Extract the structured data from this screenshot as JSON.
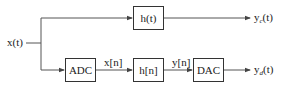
{
  "diagram": {
    "type": "block-diagram",
    "colors": {
      "line": "#555555",
      "box_border": "#333333",
      "text": "#222222",
      "background": "#ffffff"
    },
    "input": {
      "label": "x(t)"
    },
    "top_path": {
      "blocks": [
        {
          "id": "h_t",
          "label": "h(t)"
        }
      ],
      "output": {
        "label_main": "y",
        "label_sub": "c",
        "label_arg": "(t)"
      }
    },
    "bottom_path": {
      "blocks": [
        {
          "id": "adc",
          "label": "ADC"
        },
        {
          "id": "h_n",
          "label": "h[n]"
        },
        {
          "id": "dac",
          "label": "DAC"
        }
      ],
      "signals": [
        {
          "label": "x[n]"
        },
        {
          "label": "y[n]"
        }
      ],
      "output": {
        "label_main": "y",
        "label_sub": "d",
        "label_arg": "(t)"
      }
    }
  }
}
